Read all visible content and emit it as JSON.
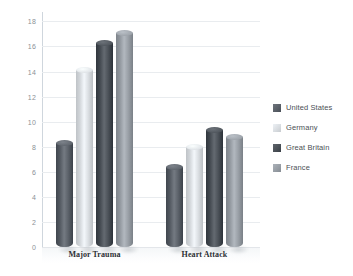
{
  "chart_data": {
    "type": "bar",
    "title": "",
    "subtitle": "",
    "xlabel": "",
    "ylabel": "",
    "categories": [
      "Major Trauma",
      "Heart Attack"
    ],
    "series": [
      {
        "name": "United States",
        "color": "#5a6068",
        "values": [
          8.3,
          6.4
        ]
      },
      {
        "name": "Germany",
        "color": "#d9dde1",
        "values": [
          14.1,
          8.0
        ]
      },
      {
        "name": "Great Britain",
        "color": "#4a5057",
        "values": [
          16.3,
          9.3
        ]
      },
      {
        "name": "France",
        "color": "#989ea5",
        "values": [
          17.1,
          8.8
        ]
      }
    ],
    "ylim": [
      0,
      18
    ],
    "ytick_step": 2,
    "ytick_labels": [
      "18",
      "16",
      "14",
      "12",
      "10",
      "8",
      "6",
      "4",
      "2",
      "0"
    ],
    "ytick_values": [
      18,
      16,
      14,
      12,
      10,
      8,
      6,
      4,
      2,
      0
    ],
    "grid": true,
    "grid_color": "#e9ecef",
    "legend_position": "right",
    "bar_style": "3d-cylinder",
    "background_color": "#ffffff",
    "axis_color": "#cfd6dd"
  },
  "legend": {
    "items": [
      {
        "label": "United States",
        "color": "#5a6068"
      },
      {
        "label": "Germany",
        "color": "#d9dde1"
      },
      {
        "label": "Great Britain",
        "color": "#4a5057"
      },
      {
        "label": "France",
        "color": "#989ea5"
      }
    ]
  }
}
